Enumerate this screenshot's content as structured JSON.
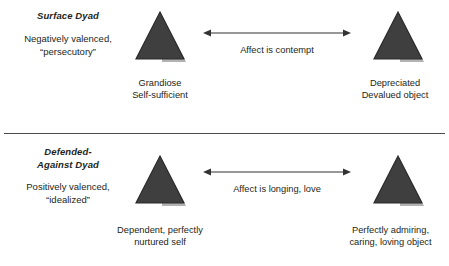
{
  "diagram": {
    "title_hidden": "",
    "colors": {
      "triangle_fill": "#3f3f3f",
      "triangle_stroke": "#2b2b2b",
      "text": "#231f20",
      "line": "#333333",
      "divider": "#4a4a4a",
      "background": "#ffffff"
    },
    "divider_label": "section-divider"
  },
  "rows": [
    {
      "id": "surface-dyad",
      "dyad_title": "Surface Dyad",
      "dyad_description": "Negatively valenced,\n“persecutory”",
      "affect_label": "Affect is contempt",
      "left_node": {
        "shape": "triangle",
        "caption": "Grandiose\nSelf-sufficient"
      },
      "right_node": {
        "shape": "triangle",
        "caption": "Depreciated\nDevalued object"
      },
      "arrow": {
        "name": "double-headed-arrow",
        "direction": "bidirectional"
      }
    },
    {
      "id": "defended-against-dyad",
      "dyad_title": "Defended-\nAgainst Dyad",
      "dyad_description": "Positively valenced,\n“idealized”",
      "affect_label": "Affect is longing, love",
      "left_node": {
        "shape": "triangle",
        "caption": "Dependent, perfectly\nnurtured self"
      },
      "right_node": {
        "shape": "triangle",
        "caption": "Perfectly admiring,\ncaring, loving object"
      },
      "arrow": {
        "name": "double-headed-arrow",
        "direction": "bidirectional"
      }
    }
  ]
}
